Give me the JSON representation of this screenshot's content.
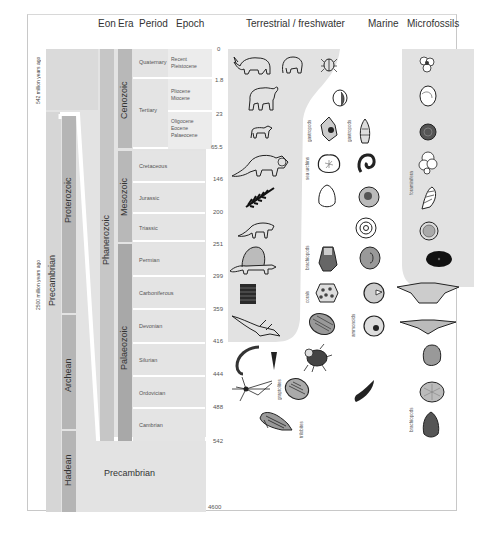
{
  "headers": {
    "eon": "Eon",
    "era": "Era",
    "period": "Period",
    "epoch": "Epoch",
    "terrestrial": "Terrestrial / freshwater",
    "marine": "Marine",
    "microfossils": "Microfossils"
  },
  "side_labels": {
    "left_top": "542 million years ago",
    "left_bottom": "2500 million years ago"
  },
  "eons_left": {
    "precambrian": "Precambrian",
    "proterozoic": "Proterozoic",
    "archean": "Archean",
    "hadean": "Hadean"
  },
  "eon_phanerozoic": "Phanerozoic",
  "eras": {
    "cenozoic": "Cenozoic",
    "mesozoic": "Mesozoic",
    "palaeozoic": "Palaeozoic"
  },
  "periods": [
    {
      "name": "Quaternary"
    },
    {
      "name": "Tertiary"
    },
    {
      "name": "Cretaceous"
    },
    {
      "name": "Jurassic"
    },
    {
      "name": "Triassic"
    },
    {
      "name": "Permian"
    },
    {
      "name": "Carboniferous"
    },
    {
      "name": "Devonian"
    },
    {
      "name": "Silurian"
    },
    {
      "name": "Ordovician"
    },
    {
      "name": "Cambrian"
    }
  ],
  "epochs": {
    "quaternary": [
      "Recent",
      "Pleistocene"
    ],
    "tertiary_upper": [
      "Pliocene",
      "Miocene"
    ],
    "tertiary_lower": [
      "Oligocene",
      "Eocene",
      "Palaeocene"
    ]
  },
  "precambrian_block": "Precambrian",
  "ticks": [
    "0",
    "1.8",
    "23",
    "65.5",
    "146",
    "200",
    "251",
    "299",
    "359",
    "416",
    "444",
    "488",
    "542",
    "4600"
  ],
  "group_labels": {
    "gastropods": "gastropods",
    "gastropods2": "gastropods",
    "sea_urchins": "sea urchins",
    "foraminifera": "foraminifera",
    "brachiopods": "brachiopods",
    "corals": "corals",
    "ammonoids": "ammonoids",
    "graptolites": "graptolites",
    "trilobites": "trilobites",
    "brachiopods_micro": "brachiopods"
  },
  "colors": {
    "background": "#ffffff",
    "frame": "#c8c8c8",
    "panel_light": "#e6e6e6",
    "panel_mid": "#d4d4d4",
    "bar_dark": "#b0b0b0",
    "fossil_ink": "#2a2a2a"
  }
}
